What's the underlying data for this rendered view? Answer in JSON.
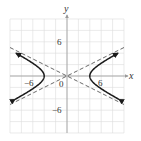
{
  "chart_data": {
    "type": "line",
    "title": "",
    "xlabel": "x",
    "ylabel": "y",
    "xlim": [
      -10,
      10
    ],
    "ylim": [
      -10,
      10
    ],
    "grid": true,
    "grid_step": 2,
    "x_tick_labels": [
      {
        "value": -6,
        "label": "−6"
      },
      {
        "value": 0,
        "label": "0"
      },
      {
        "value": 6,
        "label": "6"
      }
    ],
    "y_tick_labels": [
      {
        "value": 6,
        "label": "6"
      },
      {
        "value": -6,
        "label": "−6"
      }
    ],
    "series": [
      {
        "name": "hyperbola",
        "equation": "x^2/16 - y^2/4 = 1",
        "style": "solid",
        "arrows": true,
        "vertices": [
          [
            -4,
            0
          ],
          [
            4,
            0
          ]
        ]
      },
      {
        "name": "asymptote-1",
        "equation": "y = x/2",
        "style": "dashed"
      },
      {
        "name": "asymptote-2",
        "equation": "y = -x/2",
        "style": "dashed"
      }
    ]
  },
  "labels": {
    "x_axis": "x",
    "y_axis": "y",
    "tick_pos6": "6",
    "tick_neg6": "−6",
    "origin": "0"
  },
  "colors": {
    "curve": "#1a1a1a",
    "asymptote": "#444444",
    "grid": "#dcdcdc",
    "axis": "#9a9a9a"
  }
}
